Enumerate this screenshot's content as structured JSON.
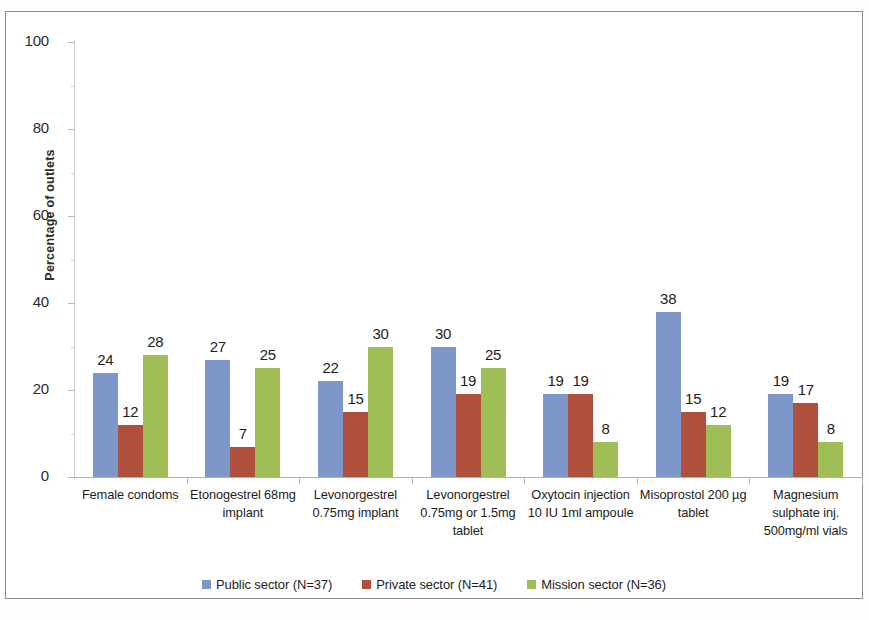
{
  "chart_data": {
    "type": "bar",
    "title": "",
    "subtitle": "",
    "xlabel": "",
    "ylabel": "Percentage of outlets",
    "ylim": [
      0,
      100
    ],
    "yticks": [
      0,
      20,
      40,
      60,
      80,
      100
    ],
    "grid": false,
    "legend_position": "bottom",
    "categories": [
      "Female condoms",
      "Etonogestrel 68mg implant",
      "Levonorgestrel 0.75mg implant",
      "Levonorgestrel 0.75mg or 1.5mg tablet",
      "Oxytocin injection 10 IU 1ml ampoule",
      "Misoprostol 200 µg tablet",
      "Magnesium sulphate inj. 500mg/ml vials"
    ],
    "category_lines": [
      [
        "Female condoms"
      ],
      [
        "Etonogestrel 68mg",
        "implant"
      ],
      [
        "Levonorgestrel",
        "0.75mg implant"
      ],
      [
        "Levonorgestrel",
        "0.75mg or 1.5mg",
        "tablet"
      ],
      [
        "Oxytocin injection",
        "10 IU 1ml ampoule"
      ],
      [
        "Misoprostol 200 µg",
        "tablet"
      ],
      [
        "Magnesium",
        "sulphate inj.",
        "500mg/ml vials"
      ]
    ],
    "series": [
      {
        "name": "Public sector (N=37)",
        "color": "#7d97c9",
        "values": [
          24,
          27,
          22,
          30,
          19,
          38,
          19
        ]
      },
      {
        "name": "Private sector (N=41)",
        "color": "#b0503c",
        "values": [
          12,
          7,
          15,
          19,
          19,
          15,
          17
        ]
      },
      {
        "name": "Mission sector (N=36)",
        "color": "#9fbe56",
        "values": [
          28,
          25,
          30,
          25,
          8,
          12,
          8
        ]
      }
    ]
  },
  "axis": {
    "y_title": "Percentage of outlets",
    "y_tick_labels": [
      "0",
      "20",
      "40",
      "60",
      "80",
      "100"
    ]
  },
  "legend": {
    "items": [
      {
        "label": "Public sector (N=37)",
        "color": "#7d97c9"
      },
      {
        "label": "Private sector (N=41)",
        "color": "#b0503c"
      },
      {
        "label": "Mission sector (N=36)",
        "color": "#9fbe56"
      }
    ]
  }
}
